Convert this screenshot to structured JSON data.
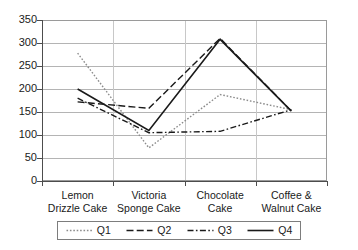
{
  "chart_data": {
    "type": "line",
    "title": "",
    "xlabel": "",
    "ylabel": "",
    "categories": [
      "Lemon Drizzle Cake",
      "Victoria Sponge Cake",
      "Chocolate Cake",
      "Coffee & Walnut Cake"
    ],
    "category_lines": [
      [
        "Lemon",
        "Drizzle Cake"
      ],
      [
        "Victoria",
        "Sponge Cake"
      ],
      [
        "Chocolate",
        "Cake"
      ],
      [
        "Coffee &",
        "Walnut Cake"
      ]
    ],
    "series": [
      {
        "name": "Q1",
        "values": [
          278,
          72,
          188,
          155
        ],
        "style": "dotted",
        "color": "#8c8c8c"
      },
      {
        "name": "Q2",
        "values": [
          172,
          158,
          310,
          152
        ],
        "style": "dashed",
        "color": "#1a1a1a"
      },
      {
        "name": "Q3",
        "values": [
          180,
          105,
          108,
          155
        ],
        "style": "dash-dot",
        "color": "#1a1a1a"
      },
      {
        "name": "Q4",
        "values": [
          200,
          110,
          308,
          152
        ],
        "style": "solid",
        "color": "#1a1a1a"
      }
    ],
    "ylim": [
      0,
      350
    ],
    "ytick_step": 50,
    "yticks": [
      350,
      300,
      250,
      200,
      150,
      100,
      50,
      0
    ],
    "ytick_labels": [
      "350",
      "300",
      "250",
      "200",
      "150",
      "100",
      "50",
      "0"
    ],
    "grid": true,
    "grid_axis": "y",
    "legend_position": "bottom",
    "legend_entries": [
      "Q1",
      "Q2",
      "Q3",
      "Q4"
    ]
  }
}
